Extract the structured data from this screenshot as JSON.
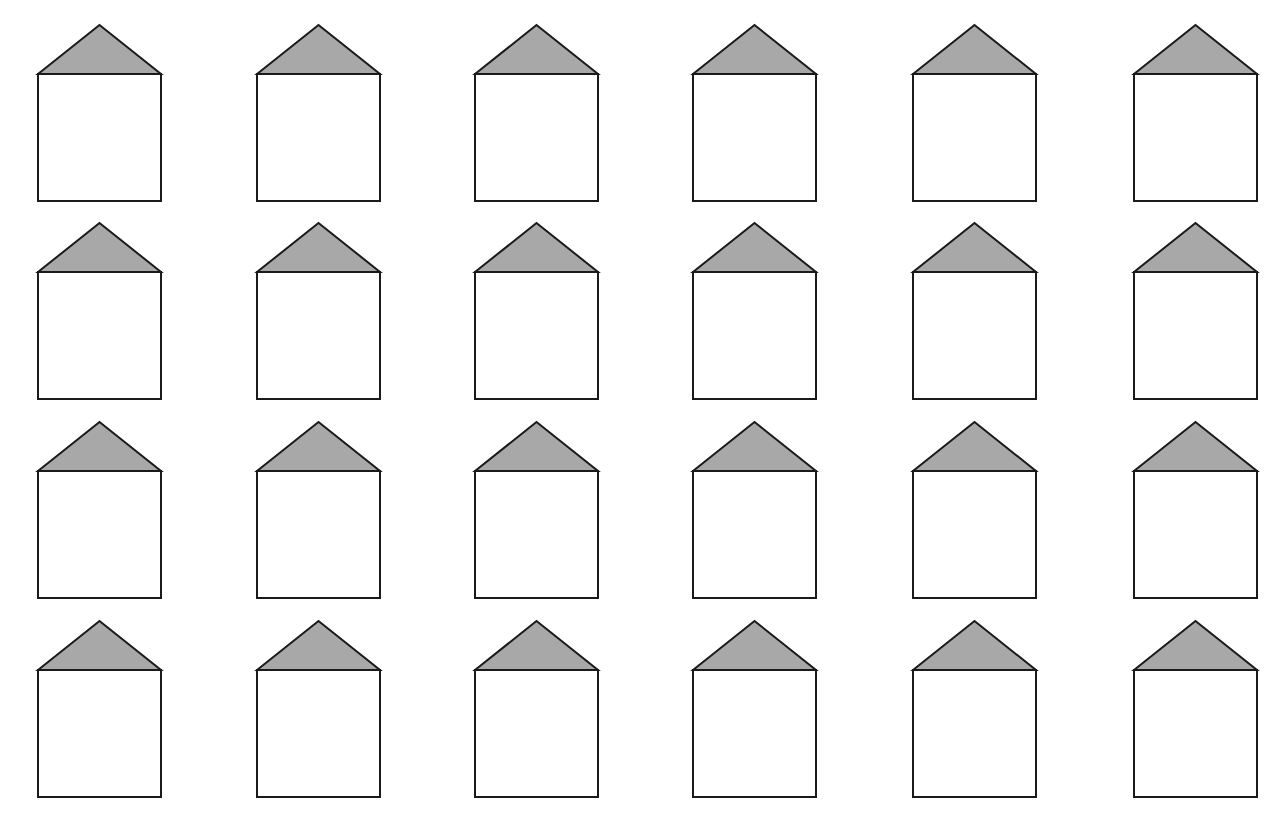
{
  "diagram": {
    "type": "grid-of-house-shapes",
    "rows": 4,
    "columns": 6,
    "column_x": [
      37,
      256,
      474,
      692,
      912,
      1133
    ],
    "row_apex_y": [
      24,
      222,
      421,
      620
    ],
    "house": {
      "width": 125,
      "roof_height": 50,
      "body_height": 128,
      "stroke_width": 2
    },
    "colors": {
      "background": "#ffffff",
      "stroke": "#1a1a1a",
      "roof_fill": "#a8a8a8",
      "body_fill": "#ffffff"
    }
  }
}
